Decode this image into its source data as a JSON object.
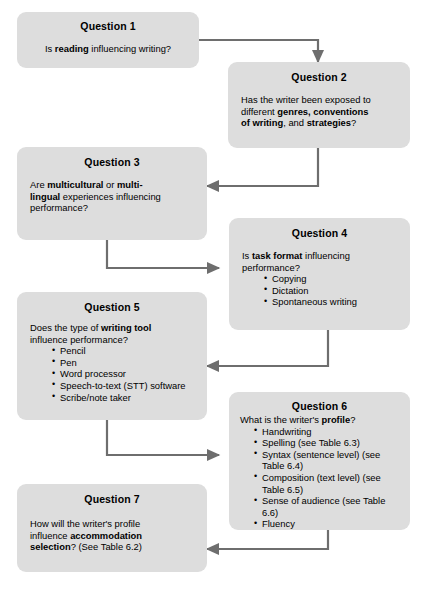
{
  "diagram": {
    "box_fill": "#dddddd",
    "arrow_color": "#6e6e6e",
    "text_color": "#000000",
    "nodes": [
      {
        "id": "q1",
        "title": "Question 1",
        "lines": [
          [
            {
              "t": "Is ",
              "b": false
            },
            {
              "t": "reading",
              "b": true
            },
            {
              "t": " influencing writing?",
              "b": false
            }
          ]
        ],
        "bullets": []
      },
      {
        "id": "q2",
        "title": "Question 2",
        "lines": [
          [
            {
              "t": "Has the writer been exposed to",
              "b": false
            }
          ],
          [
            {
              "t": "different ",
              "b": false
            },
            {
              "t": "genres, conventions",
              "b": true
            }
          ],
          [
            {
              "t": "of writing",
              "b": true
            },
            {
              "t": ", and ",
              "b": false
            },
            {
              "t": "strategies",
              "b": true
            },
            {
              "t": "?",
              "b": false
            }
          ]
        ],
        "bullets": []
      },
      {
        "id": "q3",
        "title": "Question 3",
        "lines": [
          [
            {
              "t": "Are ",
              "b": false
            },
            {
              "t": "multicultural",
              "b": true
            },
            {
              "t": " or ",
              "b": false
            },
            {
              "t": "multi-",
              "b": true
            }
          ],
          [
            {
              "t": "lingual",
              "b": true
            },
            {
              "t": " experiences influencing",
              "b": false
            }
          ],
          [
            {
              "t": "performance?",
              "b": false
            }
          ]
        ],
        "bullets": []
      },
      {
        "id": "q4",
        "title": "Question 4",
        "lines": [
          [
            {
              "t": "Is ",
              "b": false
            },
            {
              "t": "task format",
              "b": true
            },
            {
              "t": " influencing",
              "b": false
            }
          ],
          [
            {
              "t": "performance?",
              "b": false
            }
          ]
        ],
        "bullets": [
          "Copying",
          "Dictation",
          "Spontaneous writing"
        ]
      },
      {
        "id": "q5",
        "title": "Question 5",
        "lines": [
          [
            {
              "t": "Does the type of ",
              "b": false
            },
            {
              "t": "writing tool",
              "b": true
            }
          ],
          [
            {
              "t": "influence performance?",
              "b": false
            }
          ]
        ],
        "bullets": [
          "Pencil",
          "Pen",
          "Word processor",
          "Speech-to-text (STT) software",
          "Scribe/note taker"
        ]
      },
      {
        "id": "q6",
        "title": "Question 6",
        "lines": [
          [
            {
              "t": "What is the writer's ",
              "b": false
            },
            {
              "t": "profile",
              "b": true
            },
            {
              "t": "?",
              "b": false
            }
          ]
        ],
        "bullets": [
          "Handwriting",
          "Spelling (see Table 6.3)",
          "Syntax (sentence level) (see Table 6.4)",
          "Composition (text level) (see Table 6.5)",
          "Sense of audience (see Table 6.6)",
          "Fluency"
        ]
      },
      {
        "id": "q7",
        "title": "Question 7",
        "lines": [
          [
            {
              "t": "How will the writer's profile",
              "b": false
            }
          ],
          [
            {
              "t": "influence ",
              "b": false
            },
            {
              "t": "accommodation",
              "b": true
            }
          ],
          [
            {
              "t": "selection",
              "b": true
            },
            {
              "t": "? (See Table 6.2)",
              "b": false
            }
          ]
        ],
        "bullets": []
      }
    ],
    "connectors": [
      {
        "id": "q1-to-q2",
        "from": "q1",
        "to": "q2"
      },
      {
        "id": "q2-to-q3",
        "from": "q2",
        "to": "q3"
      },
      {
        "id": "q3-to-q4",
        "from": "q3",
        "to": "q4"
      },
      {
        "id": "q4-to-q5",
        "from": "q4",
        "to": "q5"
      },
      {
        "id": "q5-to-q6",
        "from": "q5",
        "to": "q6"
      },
      {
        "id": "q6-to-q7",
        "from": "q6",
        "to": "q7"
      }
    ]
  }
}
